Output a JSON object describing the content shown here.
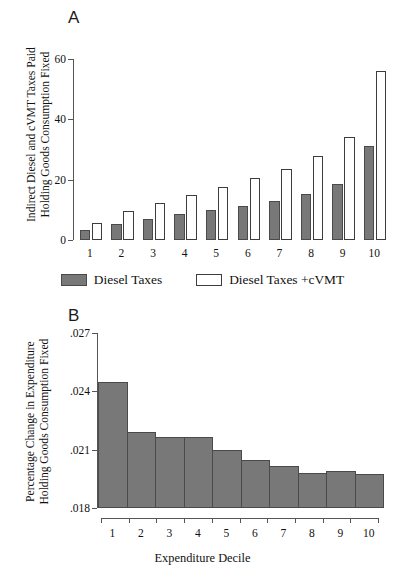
{
  "figure": {
    "panelA_letter": "A",
    "panelB_letter": "B"
  },
  "legend": {
    "items": [
      {
        "label": "Diesel Taxes",
        "style": "solid",
        "color": "#787878"
      },
      {
        "label": "Diesel Taxes +cVMT",
        "style": "hollow",
        "color": "#ffffff"
      }
    ]
  },
  "chart_data": [
    {
      "id": "panelA",
      "type": "bar",
      "title": "A",
      "xlabel": "",
      "ylabel": "Indirect Diesel and cVMT Taxes Paid Holding Goods Consumption Fixed",
      "ylabel_line1": "Indirect Diesel and cVMT Taxes Paid",
      "ylabel_line2": "Holding Goods Consumption Fixed",
      "categories": [
        "1",
        "2",
        "3",
        "4",
        "5",
        "6",
        "7",
        "8",
        "9",
        "10"
      ],
      "series": [
        {
          "name": "Diesel Taxes",
          "values": [
            3.3,
            5.4,
            7.0,
            8.6,
            9.9,
            11.3,
            12.9,
            15.2,
            18.7,
            31.0
          ]
        },
        {
          "name": "Diesel Taxes +cVMT",
          "values": [
            5.6,
            9.6,
            12.3,
            14.8,
            17.6,
            20.4,
            23.6,
            27.8,
            34.2,
            56.0
          ]
        }
      ],
      "ylim": [
        0,
        60
      ],
      "yticks": [
        0,
        20,
        40,
        60
      ],
      "ytick_labels": [
        "0",
        "20",
        "40",
        "60"
      ],
      "grid": false,
      "legend_position": "bottom"
    },
    {
      "id": "panelB",
      "type": "bar",
      "title": "B",
      "xlabel": "Expenditure Decile",
      "ylabel": "Percentage Change in Expenditure Holding Goods Consumption Fixed",
      "ylabel_line1": "Percentage Change in Expenditure",
      "ylabel_line2": "Holding Goods Consumption Fixed",
      "categories": [
        "1",
        "2",
        "3",
        "4",
        "5",
        "6",
        "7",
        "8",
        "9",
        "10"
      ],
      "values": [
        0.0245,
        0.0219,
        0.02165,
        0.02165,
        0.021,
        0.02045,
        0.02015,
        0.0198,
        0.0199,
        0.01975
      ],
      "ylim": [
        0.018,
        0.027
      ],
      "yticks": [
        0.018,
        0.021,
        0.024,
        0.027
      ],
      "ytick_labels": [
        ".018",
        ".021",
        ".024",
        ".027"
      ],
      "grid": false,
      "legend_position": "none"
    }
  ]
}
